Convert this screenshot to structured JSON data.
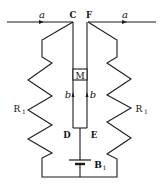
{
  "diagram": {
    "type": "circuit",
    "labels": {
      "current_left": "a",
      "current_right": "a",
      "node_c": "C",
      "node_f": "F",
      "meter": "M",
      "current_b_left": "b",
      "current_b_right": "b",
      "node_d": "D",
      "node_e": "E",
      "resistor_left": "R",
      "resistor_left_sub": "1",
      "resistor_right": "R",
      "resistor_right_sub": "1",
      "battery": "B",
      "battery_sub": "1"
    },
    "colors": {
      "stroke": "#1a1a1a",
      "background": "#ffffff"
    }
  }
}
